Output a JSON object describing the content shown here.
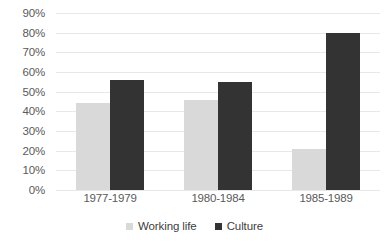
{
  "chart_data": {
    "type": "bar",
    "title": "",
    "subtitle": "",
    "xlabel": "",
    "ylabel": "",
    "categories": [
      "1977-1979",
      "1980-1984",
      "1985-1989"
    ],
    "series": [
      {
        "name": "Working life",
        "color": "#d9d9d9",
        "values": [
          44,
          46,
          21
        ]
      },
      {
        "name": "Culture",
        "color": "#333333",
        "values": [
          56,
          55,
          80
        ]
      }
    ],
    "ylim": [
      0,
      90
    ],
    "ytick_step": 10,
    "ytick_labels": [
      "90%",
      "80%",
      "70%",
      "60%",
      "50%",
      "40%",
      "30%",
      "20%",
      "10%",
      "0%"
    ],
    "ytick_values": [
      90,
      80,
      70,
      60,
      50,
      40,
      30,
      20,
      10,
      0
    ],
    "value_format": "percent",
    "grid": "horizontal",
    "legend_position": "bottom",
    "background_color": "#ffffff",
    "gridline_color": "#e8e8e8",
    "text_color": "#5a5a5a"
  }
}
